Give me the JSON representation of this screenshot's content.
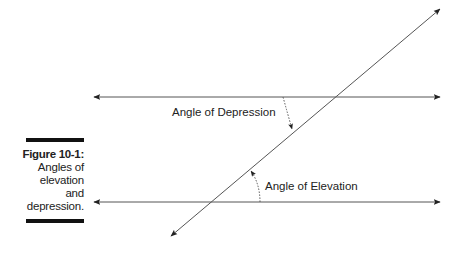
{
  "figure": {
    "label": "Figure 10-1:",
    "caption_lines": [
      "Angles of",
      "elevation",
      "and",
      "depression."
    ]
  },
  "diagram": {
    "labels": {
      "depression": "Angle of Depression",
      "elevation": "Angle of Elevation"
    },
    "colors": {
      "line": "#555555",
      "text": "#222222",
      "bar": "#111111"
    }
  }
}
